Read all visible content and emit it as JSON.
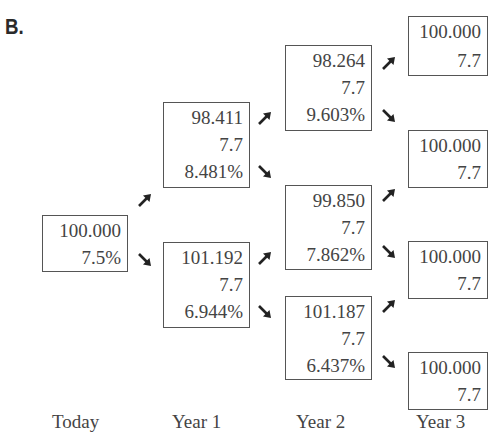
{
  "title": "B.",
  "columns": [
    "Today",
    "Year 1",
    "Year 2",
    "Year 3"
  ],
  "nodes": {
    "today": {
      "price": "100.000",
      "rate": "7.5%"
    },
    "y1_up": {
      "price": "98.411",
      "coupon": "7.7",
      "rate": "8.481%"
    },
    "y1_down": {
      "price": "101.192",
      "coupon": "7.7",
      "rate": "6.944%"
    },
    "y2_up": {
      "price": "98.264",
      "coupon": "7.7",
      "rate": "9.603%"
    },
    "y2_mid": {
      "price": "99.850",
      "coupon": "7.7",
      "rate": "7.862%"
    },
    "y2_down": {
      "price": "101.187",
      "coupon": "7.7",
      "rate": "6.437%"
    },
    "y3_1": {
      "price": "100.000",
      "coupon": "7.7"
    },
    "y3_2": {
      "price": "100.000",
      "coupon": "7.7"
    },
    "y3_3": {
      "price": "100.000",
      "coupon": "7.7"
    },
    "y3_4": {
      "price": "100.000",
      "coupon": "7.7"
    }
  },
  "arrow_icons": {
    "up": "arrow-up-right-icon",
    "down": "arrow-down-right-icon"
  }
}
